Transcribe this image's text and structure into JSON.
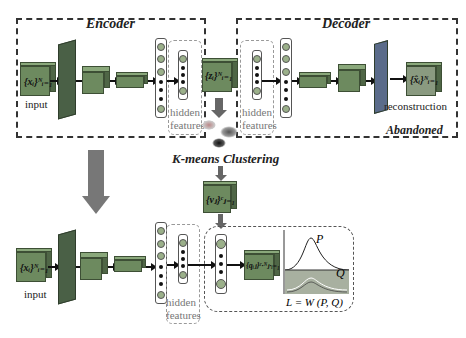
{
  "encoder": {
    "title": "Encoder",
    "input_label": "input",
    "input_math": "{xᵢ}ᴺᵢ₌₁",
    "hidden_label": "hidden\nfeatures"
  },
  "latent": {
    "math": "{zᵢ}ᴺᵢ₌₁"
  },
  "decoder": {
    "title": "Decoder",
    "output_label": "reconstruction",
    "output_math": "{x̂ᵢ}ᴺᵢ₌₁",
    "hidden_label": "hidden\nfeatures",
    "status": "Abandoned"
  },
  "clustering": {
    "title": "K-means Clustering",
    "centroid_math": "{vⱼ}ᶜⱼ₌₁"
  },
  "bottom": {
    "input_label": "input",
    "input_math": "{xᵢ}ᴺᵢ₌₁",
    "hidden_label": "hidden\nfeatures",
    "q_math": "{qᵢⱼ}ᶜ·ᴺⱼ·ᵢ₌₁",
    "p_label": "P",
    "q_label": "Q",
    "loss": "L = W (P, Q)"
  },
  "colors": {
    "block": "#6d8a5f",
    "slab": "#4a6046",
    "node": "#9bb08a"
  }
}
